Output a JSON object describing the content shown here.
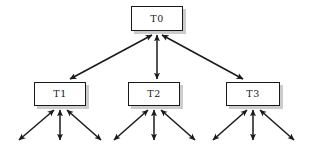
{
  "figure": {
    "type": "tree-diagram",
    "background_color": "#ffffff",
    "line_color": "#1a1a1a",
    "text_color": "#161616",
    "width": 309,
    "height": 154
  },
  "nodes": [
    {
      "id": "t0",
      "label": "T0",
      "level": 0,
      "x": 131,
      "y": 6,
      "w": 52,
      "h": 25
    },
    {
      "id": "t1",
      "label": "T1",
      "level": 1,
      "x": 34,
      "y": 82,
      "w": 52,
      "h": 24
    },
    {
      "id": "t2",
      "label": "T2",
      "level": 1,
      "x": 128,
      "y": 82,
      "w": 52,
      "h": 24
    },
    {
      "id": "t3",
      "label": "T3",
      "level": 1,
      "x": 226,
      "y": 82,
      "w": 54,
      "h": 24
    }
  ],
  "edges": [
    {
      "from": "t0",
      "to": "t1",
      "style": "double-headed-arrow"
    },
    {
      "from": "t0",
      "to": "t2",
      "style": "double-headed-arrow"
    },
    {
      "from": "t0",
      "to": "t3",
      "style": "double-headed-arrow"
    }
  ],
  "leaf_arrows": {
    "description": "three double-headed arrows fanning downward from each level-1 node",
    "count_per_node": 3,
    "directions": [
      "down-left",
      "down",
      "down-right"
    ],
    "groups": [
      {
        "parent": "t1",
        "origin_x": 60,
        "origin_y": 108
      },
      {
        "parent": "t2",
        "origin_x": 154,
        "origin_y": 108
      },
      {
        "parent": "t3",
        "origin_x": 253,
        "origin_y": 108
      }
    ]
  }
}
